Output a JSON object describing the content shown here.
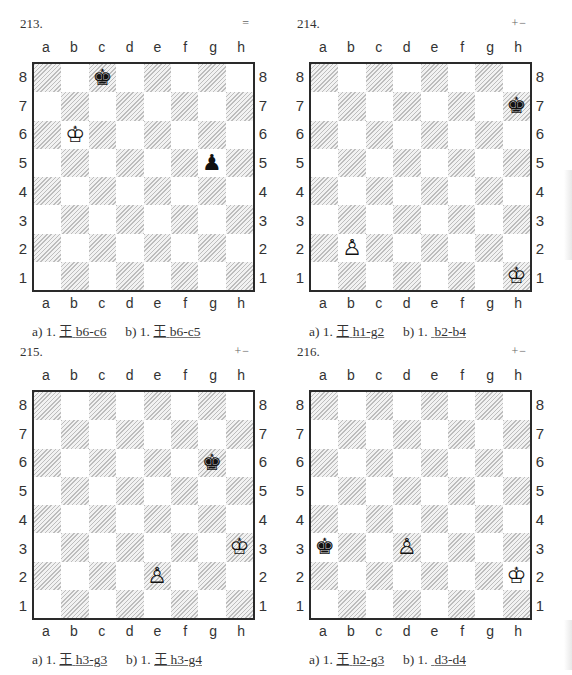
{
  "files": [
    "a",
    "b",
    "c",
    "d",
    "e",
    "f",
    "g",
    "h"
  ],
  "ranks": [
    "8",
    "7",
    "6",
    "5",
    "4",
    "3",
    "2",
    "1"
  ],
  "diagrams": [
    {
      "number": "213.",
      "evaluation": "=",
      "pieces": [
        {
          "square": "c8",
          "type": "king",
          "color": "black",
          "glyph": "♚"
        },
        {
          "square": "b6",
          "type": "king",
          "color": "white",
          "glyph": "♔"
        },
        {
          "square": "g5",
          "type": "pawn",
          "color": "black",
          "glyph": "♟"
        }
      ],
      "caption": {
        "a_prefix": "a) 1.",
        "a_icon": "王",
        "a_move": "b6-c6",
        "b_prefix": "b) 1.",
        "b_icon": "王",
        "b_move": "b6-c5"
      }
    },
    {
      "number": "214.",
      "evaluation": "+−",
      "pieces": [
        {
          "square": "h7",
          "type": "king",
          "color": "black",
          "glyph": "♚"
        },
        {
          "square": "b2",
          "type": "pawn",
          "color": "white",
          "glyph": "♙"
        },
        {
          "square": "h1",
          "type": "king",
          "color": "white",
          "glyph": "♔"
        }
      ],
      "caption": {
        "a_prefix": "a) 1.",
        "a_icon": "王",
        "a_move": "h1-g2",
        "b_prefix": "b) 1.",
        "b_icon": "",
        "b_move": "b2-b4"
      }
    },
    {
      "number": "215.",
      "evaluation": "+−",
      "pieces": [
        {
          "square": "g6",
          "type": "king",
          "color": "black",
          "glyph": "♚"
        },
        {
          "square": "h3",
          "type": "king",
          "color": "white",
          "glyph": "♔"
        },
        {
          "square": "e2",
          "type": "pawn",
          "color": "white",
          "glyph": "♙"
        }
      ],
      "caption": {
        "a_prefix": "a) 1.",
        "a_icon": "王",
        "a_move": "h3-g3",
        "b_prefix": "b) 1.",
        "b_icon": "王",
        "b_move": "h3-g4"
      }
    },
    {
      "number": "216.",
      "evaluation": "+−",
      "pieces": [
        {
          "square": "a3",
          "type": "king",
          "color": "black",
          "glyph": "♚"
        },
        {
          "square": "d3",
          "type": "pawn",
          "color": "white",
          "glyph": "♙"
        },
        {
          "square": "h2",
          "type": "king",
          "color": "white",
          "glyph": "♔"
        }
      ],
      "caption": {
        "a_prefix": "a) 1.",
        "a_icon": "王",
        "a_move": "h2-g3",
        "b_prefix": "b) 1.",
        "b_icon": "",
        "b_move": "d3-d4"
      }
    }
  ]
}
